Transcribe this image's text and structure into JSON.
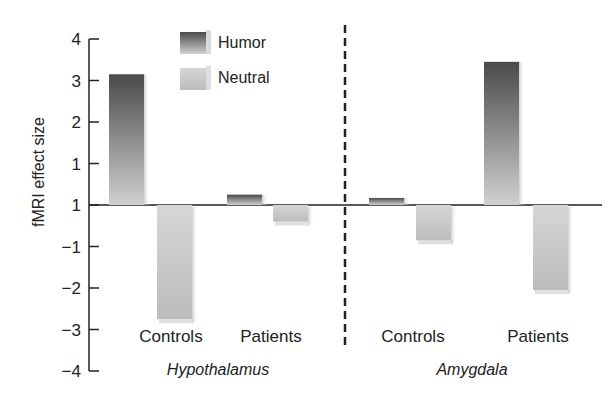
{
  "chart_data": {
    "type": "bar",
    "title": "",
    "xlabel": "",
    "ylabel": "fMRI effect size",
    "ylim": [
      -4,
      4
    ],
    "yticks": [
      4,
      3,
      2,
      1,
      0,
      -1,
      -2,
      -3,
      -4
    ],
    "ytick_labels": [
      "4",
      "3",
      "2",
      "1",
      "1",
      "−1",
      "−2",
      "−3",
      "−4"
    ],
    "grid": false,
    "legend_position": "top-left-inside",
    "legend": [
      "Humor",
      "Neutral"
    ],
    "groups": [
      {
        "name": "Hypothalamus",
        "categories": [
          "Controls",
          "Patients"
        ]
      },
      {
        "name": "Amygdala",
        "categories": [
          "Controls",
          "Patients"
        ]
      }
    ],
    "categories": [
      "Hypothalamus Controls",
      "Hypothalamus Patients",
      "Amygdala Controls",
      "Amygdala Patients"
    ],
    "series": [
      {
        "name": "Humor",
        "color": "#555555",
        "values": [
          3.15,
          0.25,
          0.17,
          3.45
        ]
      },
      {
        "name": "Neutral",
        "color": "#c8c8c8",
        "values": [
          -2.75,
          -0.4,
          -0.85,
          -2.05
        ]
      }
    ],
    "annotations": [
      "Dashed vertical separator between Hypothalamus and Amygdala groups"
    ]
  },
  "colors": {
    "humor_top": "#4a4a4a",
    "humor_bottom": "#d0d0d0",
    "neutral_top": "#d4d4d4",
    "neutral_bottom": "#b8b8b8",
    "axis": "#222222"
  }
}
